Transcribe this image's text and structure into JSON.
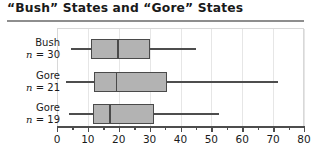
{
  "chart_data": {
    "type": "box",
    "title": "“Bush” States and “Gore” States",
    "xlabel": "",
    "ylabel": "",
    "xlim": [
      0,
      80
    ],
    "grid": true,
    "legend": "none",
    "tick_step_major": 10,
    "tick_step_minor": 5,
    "xticks": [
      "0",
      "10",
      "20",
      "30",
      "40",
      "50",
      "60",
      "70",
      "80"
    ],
    "xtick_values": [
      0,
      10,
      20,
      30,
      40,
      50,
      60,
      70,
      80
    ],
    "orientation": "horizontal",
    "groups": [
      {
        "name": "Bush",
        "label_line1": "Bush",
        "label_line2_prefix": "n",
        "label_line2_rest": " = 30",
        "n": 30,
        "whisker_low": 4.5,
        "q1": 11,
        "median": 19.5,
        "q3": 30,
        "whisker_high": 45
      },
      {
        "name": "Gore",
        "label_line1": "Gore",
        "label_line2_prefix": "n",
        "label_line2_rest": " = 21",
        "n": 21,
        "whisker_low": 3,
        "q1": 12,
        "median": 19,
        "q3": 35.5,
        "whisker_high": 71.5
      },
      {
        "name": "Gore",
        "label_line1": "Gore",
        "label_line2_prefix": "n",
        "label_line2_rest": " = 19",
        "n": 19,
        "whisker_low": 4,
        "q1": 11.5,
        "median": 17,
        "q3": 31.5,
        "whisker_high": 52.5
      }
    ],
    "colors": {
      "box_fill": "#b3b3b3",
      "box_edge": "#4a4a4a",
      "whisker": "#4d4d4d",
      "grid": "#e6e6e6",
      "axis": "#4d4d4d",
      "text": "#1a1a1a",
      "rule": "#8e8e8e",
      "background": "#ffffff"
    }
  }
}
